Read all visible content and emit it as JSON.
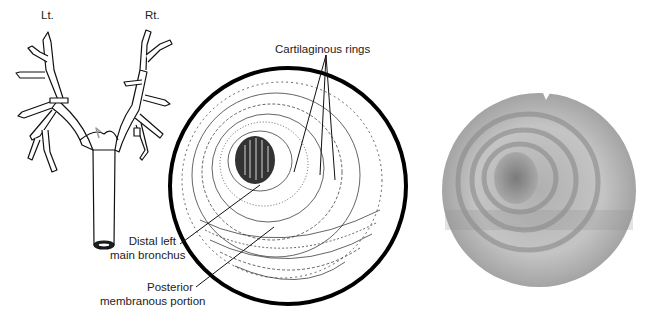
{
  "figure": {
    "panels": [
      {
        "id": "bronchial-tree",
        "title": "Bronchial tree schematic",
        "orientation_labels": {
          "left": "Lt.",
          "right": "Rt."
        }
      },
      {
        "id": "endoscopic-drawing",
        "title": "Drawing of endoscopic view",
        "callouts": {
          "cartilaginous_rings": "Cartilaginous rings",
          "distal_left_main_bronchus": [
            "Distal left",
            "main bronchus"
          ],
          "posterior_membranous_portion": [
            "Posterior",
            "membranous portion"
          ]
        }
      },
      {
        "id": "endoscopic-photo",
        "title": "Bronchoscopic photograph"
      }
    ],
    "colors": {
      "ink": "#111111",
      "photo_light": "#c8c8c8",
      "photo_dark": "#6a6a6a",
      "background": "#ffffff"
    }
  }
}
